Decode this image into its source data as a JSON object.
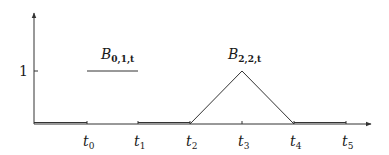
{
  "diagram": {
    "type": "bspline-basis-functions",
    "colors": {
      "line": "#333333",
      "background": "#ffffff",
      "text": "#1a1a1a"
    },
    "y_axis": {
      "tick_label": "1"
    },
    "x_axis": {
      "knots": [
        {
          "base": "t",
          "sub": "0"
        },
        {
          "base": "t",
          "sub": "1"
        },
        {
          "base": "t",
          "sub": "2"
        },
        {
          "base": "t",
          "sub": "3"
        },
        {
          "base": "t",
          "sub": "4"
        },
        {
          "base": "t",
          "sub": "5"
        }
      ]
    },
    "curves": [
      {
        "base": "B",
        "sub": "0,1,t",
        "shape": "step",
        "support": [
          "t0",
          "t1"
        ],
        "height": 1
      },
      {
        "base": "B",
        "sub": "2,2,t",
        "shape": "hat",
        "support": [
          "t2",
          "t4"
        ],
        "peak_at": "t3",
        "height": 1
      }
    ]
  }
}
